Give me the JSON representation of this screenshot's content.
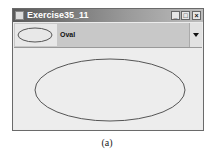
{
  "window": {
    "title": "Exercise35_11",
    "controls": {
      "minimize": "_",
      "maximize": "□",
      "close": "×"
    }
  },
  "combo": {
    "selected_label": "Oval",
    "selected_icon": "oval-icon",
    "dropdown_icon": "chevron-down-icon"
  },
  "canvas": {
    "shape": "oval",
    "stroke": "#555555"
  },
  "caption": "(a)"
}
